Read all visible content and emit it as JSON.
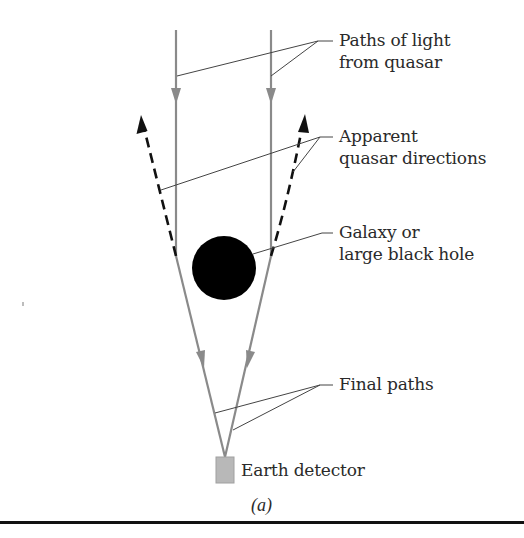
{
  "diagram": {
    "caption": "(a)",
    "labels": {
      "paths_of_light": [
        "Paths of light",
        "from quasar"
      ],
      "apparent_directions": [
        "Apparent",
        "quasar directions"
      ],
      "galaxy": [
        "Galaxy or",
        "large black hole"
      ],
      "final_paths": "Final paths",
      "earth_detector": "Earth detector"
    },
    "colors": {
      "light_path": "#8a8a8a",
      "apparent_direction": "#111111",
      "lens_body": "#000000",
      "detector": "#b8b8b8",
      "leader_line": "#444444",
      "text": "#2a2a2a"
    }
  }
}
